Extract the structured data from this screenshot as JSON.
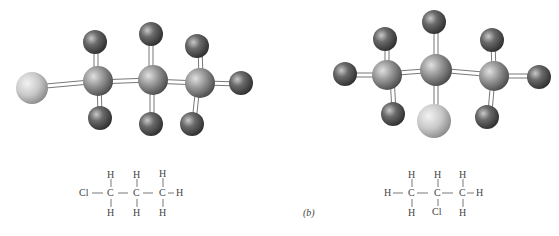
{
  "figure": {
    "panel_label": "(b)",
    "colors": {
      "carbon": "#8e8e8e",
      "hydrogen": "#5e5e5e",
      "chlorine": "#c4c4c4",
      "bond": "#ffffff",
      "bond_outline": "#777777",
      "text": "#444444"
    },
    "left_molecule": {
      "name": "1-chloropropane",
      "formula_atoms": {
        "cl": "Cl",
        "c1": "C",
        "c2": "C",
        "c3": "C",
        "h1_top": "H",
        "h1_bot": "H",
        "h2_top": "H",
        "h2_bot": "H",
        "h3_top": "H",
        "h3_bot": "H",
        "h3_right": "H"
      }
    },
    "right_molecule": {
      "name": "2-chloropropane",
      "formula_atoms": {
        "h1_left": "H",
        "c1": "C",
        "c2": "C",
        "c3": "C",
        "h1_top": "H",
        "h1_bot": "H",
        "h2_top": "H",
        "cl": "Cl",
        "h3_top": "H",
        "h3_bot": "H",
        "h3_right": "H"
      }
    }
  }
}
